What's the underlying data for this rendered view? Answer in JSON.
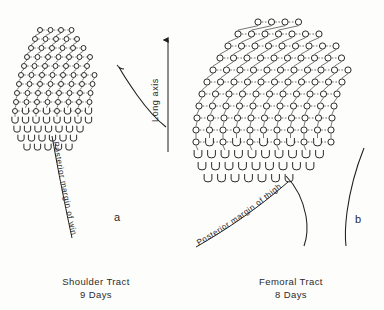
{
  "figure": {
    "background_color": "#fdfdfc",
    "ink_color": "#1d1d1d",
    "text_color": "#2b2b2b",
    "width": 384,
    "height": 310
  },
  "axis_label": {
    "text": "Long axis",
    "orientation": "vertical-bottom-to-top",
    "arrow_direction": "up"
  },
  "panels": [
    {
      "id": "a",
      "letter": "a",
      "caption_line1": "Shoulder Tract",
      "caption_line2": "9 Days",
      "margin_label": "Posterior margin of wing",
      "tract": "shoulder",
      "age_days": 9
    },
    {
      "id": "b",
      "letter": "b",
      "caption_line1": "Femoral Tract",
      "caption_line2": "8 Days",
      "margin_label": "Posterior margin of thigh",
      "tract": "femoral",
      "age_days": 8
    }
  ],
  "chart_data": {
    "type": "scatter",
    "title": "",
    "xlabel": "",
    "ylabel": "Long axis",
    "grid": false,
    "legend": false,
    "symbols": {
      "circle": "formed feather germ",
      "u_shape": "newly forming feather germ at posterior margin"
    },
    "panel_a": {
      "label": "a",
      "caption": "Shoulder Tract 9 Days",
      "row_spacing": 9.2,
      "col_spacing": 10.5,
      "row_shear_x": -3.6,
      "rows": [
        {
          "y": 30,
          "x0": 40,
          "n": 4,
          "kind": "circle"
        },
        {
          "y": 39,
          "x0": 35,
          "n": 5,
          "kind": "circle"
        },
        {
          "y": 48,
          "x0": 31,
          "n": 6,
          "kind": "circle"
        },
        {
          "y": 57,
          "x0": 27,
          "n": 7,
          "kind": "circle"
        },
        {
          "y": 66,
          "x0": 24,
          "n": 7,
          "kind": "circle"
        },
        {
          "y": 75,
          "x0": 21,
          "n": 8,
          "kind": "circle"
        },
        {
          "y": 84,
          "x0": 19,
          "n": 8,
          "kind": "circle"
        },
        {
          "y": 93,
          "x0": 17,
          "n": 8,
          "kind": "circle"
        },
        {
          "y": 102,
          "x0": 16,
          "n": 8,
          "kind": "circle"
        },
        {
          "y": 111,
          "x0": 15,
          "n": 8,
          "kind": "mixed"
        },
        {
          "y": 120,
          "x0": 15,
          "n": 8,
          "kind": "u"
        },
        {
          "y": 129,
          "x0": 17,
          "n": 7,
          "kind": "u"
        },
        {
          "y": 138,
          "x0": 21,
          "n": 6,
          "kind": "u"
        },
        {
          "y": 147,
          "x0": 27,
          "n": 5,
          "kind": "u"
        }
      ]
    },
    "panel_b": {
      "label": "b",
      "caption": "Femoral Tract 8 Days",
      "row_spacing": 12.5,
      "col_spacing": 13.5,
      "row_shear_x": -5.5,
      "rows": [
        {
          "y": 22,
          "x0": 258,
          "n": 4,
          "kind": "circle"
        },
        {
          "y": 34,
          "x0": 238,
          "n": 7,
          "kind": "circle"
        },
        {
          "y": 46,
          "x0": 228,
          "n": 9,
          "kind": "circle"
        },
        {
          "y": 58,
          "x0": 220,
          "n": 10,
          "kind": "circle"
        },
        {
          "y": 70,
          "x0": 213,
          "n": 11,
          "kind": "circle"
        },
        {
          "y": 82,
          "x0": 207,
          "n": 11,
          "kind": "circle"
        },
        {
          "y": 94,
          "x0": 202,
          "n": 11,
          "kind": "circle"
        },
        {
          "y": 106,
          "x0": 199,
          "n": 11,
          "kind": "circle"
        },
        {
          "y": 118,
          "x0": 197,
          "n": 11,
          "kind": "circle"
        },
        {
          "y": 130,
          "x0": 196,
          "n": 11,
          "kind": "circle"
        },
        {
          "y": 142,
          "x0": 196,
          "n": 11,
          "kind": "mixed"
        },
        {
          "y": 154,
          "x0": 198,
          "n": 10,
          "kind": "u"
        },
        {
          "y": 166,
          "x0": 202,
          "n": 9,
          "kind": "u"
        },
        {
          "y": 178,
          "x0": 208,
          "n": 7,
          "kind": "u"
        }
      ]
    }
  }
}
